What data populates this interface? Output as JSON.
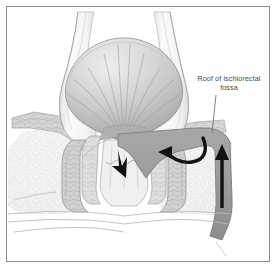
{
  "figure": {
    "background_color": "#ffffff",
    "frame_color": "#8c8c8c",
    "width": 278,
    "height": 270
  },
  "callout": {
    "line1": "Roof of ischiorectal",
    "line2": "fossa",
    "text_color": "#4a4a4a",
    "leader_color": "#6e6e6e"
  },
  "palette": {
    "lumen_fill": "#b4b4b4",
    "lumen_stroke": "#8a8a8a",
    "wall_fill": "#e8e8e8",
    "wall_stroke": "#9a9a9a",
    "muscle_fill": "#cfcfcf",
    "muscle_stroke": "#9c9c9c",
    "fat_fill": "#f2f2f2",
    "fat_stroke": "#cccccc",
    "levator_band": "#9a9a9a",
    "levator_band_stroke": "#7d7d7d",
    "arrow_black": "#111111",
    "skin_stroke": "#b8b8b8",
    "fold_stroke": "#a8a8a8"
  },
  "structures": [
    {
      "name": "rectal-ampulla",
      "label": "Rectal ampulla lumen"
    },
    {
      "name": "rectal-wall",
      "label": "Rectal wall"
    },
    {
      "name": "mucosal-folds",
      "label": "Radiating mucosal folds"
    },
    {
      "name": "anal-canal",
      "label": "Anal canal"
    },
    {
      "name": "internal-sphincter-left",
      "label": "Internal anal sphincter (left)"
    },
    {
      "name": "internal-sphincter-right",
      "label": "Internal anal sphincter (right)"
    },
    {
      "name": "external-sphincter-left",
      "label": "External anal sphincter (left)"
    },
    {
      "name": "external-sphincter-right",
      "label": "External anal sphincter (right)"
    },
    {
      "name": "levator-ani-left",
      "label": "Levator ani (left)"
    },
    {
      "name": "levator-ani-right",
      "label": "Levator ani (right)"
    },
    {
      "name": "ischiorectal-fossa-left",
      "label": "Ischiorectal fossa fat (left)"
    },
    {
      "name": "ischiorectal-fossa-right",
      "label": "Ischiorectal fossa fat (right)"
    },
    {
      "name": "perianal-skin",
      "label": "Perianal skin"
    },
    {
      "name": "roof-band",
      "label": "Roof of ischiorectal fossa band"
    }
  ],
  "arrows": [
    {
      "name": "hook-arrow",
      "label": "Curved hook arrow into fossa roof",
      "color": "#111111"
    },
    {
      "name": "ascending-arrow",
      "label": "Vertical ascending arrow",
      "color": "#111111"
    },
    {
      "name": "descending-arrow",
      "label": "Small descending arrow in anal canal",
      "color": "#111111"
    }
  ]
}
